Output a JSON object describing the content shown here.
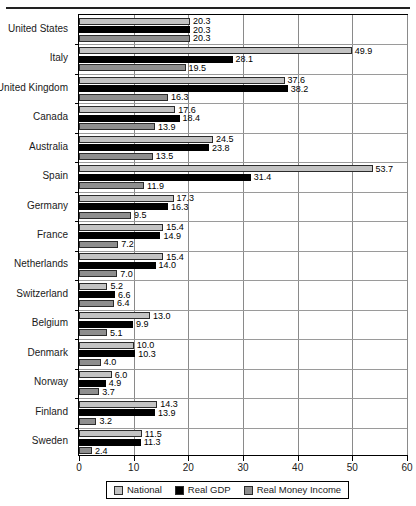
{
  "chart_data": {
    "type": "bar",
    "orientation": "horizontal",
    "title": "",
    "subtitle": "",
    "xlabel": "",
    "ylabel": "",
    "xlim": [
      0,
      60
    ],
    "xticks": [
      0,
      10,
      20,
      30,
      40,
      50,
      60
    ],
    "xtick_labels": [
      "0",
      "10",
      "20",
      "30",
      "40",
      "50",
      "60"
    ],
    "grid": true,
    "grid_axis": "x",
    "legend_position": "bottom",
    "categories": [
      "United States",
      "Italy",
      "United Kingdom",
      "Canada",
      "Australia",
      "Spain",
      "Germany",
      "France",
      "Netherlands",
      "Switzerland",
      "Belgium",
      "Denmark",
      "Norway",
      "Finland",
      "Sweden"
    ],
    "series": [
      {
        "name": "National",
        "color": "#c3c3c3",
        "values": [
          20.3,
          49.9,
          37.6,
          17.6,
          24.5,
          53.7,
          17.3,
          15.4,
          15.4,
          5.2,
          13.0,
          10.0,
          6.0,
          14.3,
          11.5
        ],
        "labels": [
          "20.3",
          "49.9",
          "37.6",
          "17.6",
          "24.5",
          "53.7",
          "17.3",
          "15.4",
          "15.4",
          "5.2",
          "13.0",
          "10.0",
          "6.0",
          "14.3",
          "11.5"
        ]
      },
      {
        "name": "Real GDP",
        "color": "#000000",
        "values": [
          20.3,
          28.1,
          38.2,
          18.4,
          23.8,
          31.4,
          16.3,
          14.9,
          14.0,
          6.6,
          9.9,
          10.3,
          4.9,
          13.9,
          11.3
        ],
        "labels": [
          "20.3",
          "28.1",
          "38.2",
          "18.4",
          "23.8",
          "31.4",
          "16.3",
          "14.9",
          "14.0",
          "6.6",
          "9.9",
          "10.3",
          "4.9",
          "13.9",
          "11.3"
        ]
      },
      {
        "name": "Real Money Income",
        "color": "#8e8e8e",
        "values": [
          20.3,
          19.5,
          16.3,
          13.9,
          13.5,
          11.9,
          9.5,
          7.2,
          7.0,
          6.4,
          5.1,
          4.0,
          3.7,
          3.2,
          2.4
        ],
        "labels": [
          "20.3",
          "19.5",
          "16.3",
          "13.9",
          "13.5",
          "11.9",
          "9.5",
          "7.2",
          "7.0",
          "6.4",
          "5.1",
          "4.0",
          "3.7",
          "3.2",
          "2.4"
        ]
      }
    ]
  },
  "legend": {
    "items": [
      {
        "label": "National",
        "color": "#c3c3c3"
      },
      {
        "label": "Real GDP",
        "color": "#000000"
      },
      {
        "label": "Real Money Income",
        "color": "#8e8e8e"
      }
    ]
  }
}
